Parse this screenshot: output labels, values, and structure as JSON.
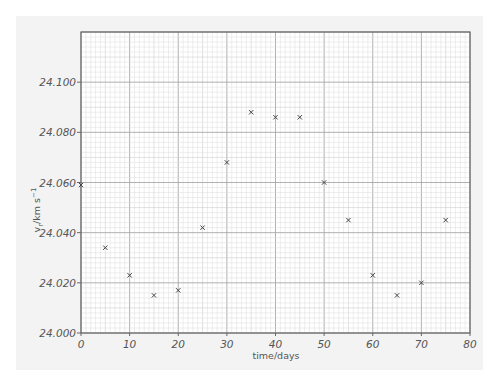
{
  "chart_data": {
    "type": "scatter",
    "title": "",
    "xlabel": "time/days",
    "ylabel": "v_r/km s^-1",
    "ylabel_parts": {
      "main": "v",
      "sub": "r",
      "unit": "/km s",
      "sup": "−1"
    },
    "xlim": [
      0,
      80
    ],
    "ylim": [
      24.0,
      24.12
    ],
    "x_ticks": [
      0,
      10,
      20,
      30,
      40,
      50,
      60,
      70,
      80
    ],
    "x_tick_labels": [
      "0",
      "10",
      "20",
      "30",
      "40",
      "50",
      "60",
      "70",
      "80"
    ],
    "y_ticks": [
      24.0,
      24.02,
      24.04,
      24.06,
      24.08,
      24.1
    ],
    "y_tick_labels": [
      "24.000",
      "24.020",
      "24.040",
      "24.060",
      "24.080",
      "24.100"
    ],
    "grid": true,
    "grid_style": "graph paper (minor 1 day / 0.002, major 10 days / 0.020)",
    "marker": "x",
    "legend": null,
    "x": [
      0,
      5,
      10,
      15,
      20,
      25,
      30,
      35,
      40,
      45,
      50,
      55,
      60,
      65,
      70,
      75
    ],
    "y": [
      24.059,
      24.034,
      24.023,
      24.015,
      24.017,
      24.042,
      24.068,
      24.088,
      24.086,
      24.086,
      24.06,
      24.045,
      24.023,
      24.015,
      24.02,
      24.045
    ]
  },
  "colors": {
    "panel": "#f3f3f3",
    "plot_bg": "#ffffff",
    "minor_grid": "#dcdcdc",
    "mid_grid": "#c4c4c4",
    "major_grid": "#a8a8a8",
    "axis": "#666666",
    "marker": "#444444",
    "text": "#555555"
  }
}
